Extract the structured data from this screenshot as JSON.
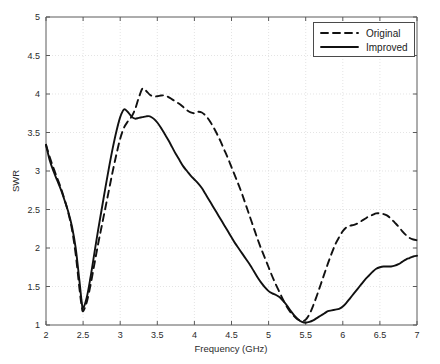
{
  "chart_data": {
    "type": "line",
    "title": "",
    "xlabel": "Frequency (GHz)",
    "ylabel": "SWR",
    "xlim": [
      2,
      7
    ],
    "ylim": [
      1,
      5
    ],
    "xticks": [
      2,
      2.5,
      3,
      3.5,
      4,
      4.5,
      5,
      5.5,
      6,
      6.5,
      7
    ],
    "xticklabels": [
      "2",
      "2.5",
      "3",
      "3.5",
      "4",
      "4.5",
      "5",
      "5.5",
      "6",
      "6.5",
      "7"
    ],
    "yticks": [
      1,
      1.5,
      2,
      2.5,
      3,
      3.5,
      4,
      4.5,
      5
    ],
    "yticklabels": [
      "1",
      "1.5",
      "2",
      "2.5",
      "3",
      "3.5",
      "4",
      "4.5",
      "5"
    ],
    "grid": true,
    "legend_position": "upper right",
    "legend_entries": [
      "Original",
      "Improved"
    ],
    "series": [
      {
        "name": "Original",
        "style": "dashed",
        "color": "#111111",
        "x": [
          2.0,
          2.05,
          2.1,
          2.15,
          2.2,
          2.25,
          2.3,
          2.35,
          2.4,
          2.45,
          2.48,
          2.5,
          2.55,
          2.6,
          2.65,
          2.7,
          2.75,
          2.8,
          2.85,
          2.9,
          2.95,
          3.0,
          3.05,
          3.1,
          3.15,
          3.2,
          3.25,
          3.3,
          3.35,
          3.4,
          3.45,
          3.5,
          3.55,
          3.6,
          3.65,
          3.7,
          3.75,
          3.8,
          3.85,
          3.9,
          3.95,
          4.0,
          4.05,
          4.1,
          4.15,
          4.2,
          4.25,
          4.3,
          4.35,
          4.4,
          4.45,
          4.5,
          4.55,
          4.6,
          4.65,
          4.7,
          4.75,
          4.8,
          4.85,
          4.9,
          4.95,
          5.0,
          5.05,
          5.1,
          5.15,
          5.2,
          5.25,
          5.3,
          5.35,
          5.4,
          5.45,
          5.5,
          5.55,
          5.6,
          5.65,
          5.7,
          5.75,
          5.8,
          5.85,
          5.9,
          5.95,
          6.0,
          6.05,
          6.1,
          6.15,
          6.2,
          6.25,
          6.3,
          6.35,
          6.4,
          6.45,
          6.5,
          6.55,
          6.6,
          6.65,
          6.7,
          6.75,
          6.8,
          6.85,
          6.9,
          6.95,
          7.0
        ],
        "y": [
          3.34,
          3.18,
          3.04,
          2.91,
          2.78,
          2.63,
          2.46,
          2.24,
          1.92,
          1.48,
          1.25,
          1.18,
          1.3,
          1.52,
          1.78,
          2.04,
          2.28,
          2.52,
          2.76,
          3.0,
          3.22,
          3.42,
          3.56,
          3.64,
          3.7,
          3.8,
          3.95,
          4.07,
          4.04,
          3.99,
          3.97,
          3.97,
          3.98,
          3.98,
          3.96,
          3.93,
          3.9,
          3.87,
          3.83,
          3.79,
          3.76,
          3.75,
          3.77,
          3.76,
          3.72,
          3.66,
          3.58,
          3.49,
          3.39,
          3.28,
          3.17,
          3.05,
          2.93,
          2.81,
          2.68,
          2.54,
          2.4,
          2.26,
          2.12,
          1.99,
          1.87,
          1.75,
          1.63,
          1.52,
          1.42,
          1.32,
          1.23,
          1.16,
          1.11,
          1.07,
          1.05,
          1.07,
          1.14,
          1.25,
          1.38,
          1.52,
          1.66,
          1.8,
          1.93,
          2.05,
          2.14,
          2.22,
          2.27,
          2.29,
          2.3,
          2.32,
          2.35,
          2.38,
          2.41,
          2.43,
          2.45,
          2.45,
          2.44,
          2.42,
          2.38,
          2.33,
          2.28,
          2.22,
          2.17,
          2.13,
          2.11,
          2.1
        ]
      },
      {
        "name": "Improved",
        "style": "solid",
        "color": "#111111",
        "x": [
          2.0,
          2.05,
          2.1,
          2.15,
          2.2,
          2.25,
          2.3,
          2.35,
          2.4,
          2.45,
          2.48,
          2.5,
          2.55,
          2.6,
          2.65,
          2.7,
          2.75,
          2.8,
          2.85,
          2.9,
          2.95,
          3.0,
          3.05,
          3.1,
          3.15,
          3.2,
          3.25,
          3.3,
          3.35,
          3.4,
          3.45,
          3.5,
          3.55,
          3.6,
          3.65,
          3.7,
          3.75,
          3.8,
          3.85,
          3.9,
          3.95,
          4.0,
          4.05,
          4.1,
          4.15,
          4.2,
          4.25,
          4.3,
          4.35,
          4.4,
          4.45,
          4.5,
          4.55,
          4.6,
          4.65,
          4.7,
          4.75,
          4.8,
          4.85,
          4.9,
          4.95,
          5.0,
          5.05,
          5.1,
          5.15,
          5.2,
          5.25,
          5.3,
          5.35,
          5.4,
          5.45,
          5.5,
          5.55,
          5.6,
          5.65,
          5.7,
          5.75,
          5.8,
          5.85,
          5.9,
          5.95,
          6.0,
          6.05,
          6.1,
          6.15,
          6.2,
          6.25,
          6.3,
          6.35,
          6.4,
          6.45,
          6.5,
          6.55,
          6.6,
          6.65,
          6.7,
          6.75,
          6.8,
          6.85,
          6.9,
          6.95,
          7.0
        ],
        "y": [
          3.34,
          3.14,
          3.0,
          2.88,
          2.76,
          2.62,
          2.47,
          2.28,
          2.0,
          1.58,
          1.31,
          1.22,
          1.36,
          1.62,
          1.92,
          2.22,
          2.5,
          2.78,
          3.05,
          3.3,
          3.52,
          3.7,
          3.8,
          3.77,
          3.71,
          3.68,
          3.69,
          3.7,
          3.71,
          3.71,
          3.68,
          3.63,
          3.56,
          3.48,
          3.4,
          3.31,
          3.22,
          3.14,
          3.06,
          3.0,
          2.94,
          2.89,
          2.84,
          2.78,
          2.7,
          2.62,
          2.54,
          2.46,
          2.38,
          2.3,
          2.22,
          2.14,
          2.06,
          1.99,
          1.92,
          1.85,
          1.78,
          1.7,
          1.62,
          1.55,
          1.49,
          1.44,
          1.41,
          1.39,
          1.36,
          1.31,
          1.25,
          1.18,
          1.12,
          1.07,
          1.04,
          1.03,
          1.04,
          1.06,
          1.09,
          1.12,
          1.15,
          1.18,
          1.19,
          1.2,
          1.21,
          1.24,
          1.29,
          1.35,
          1.41,
          1.47,
          1.53,
          1.59,
          1.64,
          1.69,
          1.73,
          1.75,
          1.76,
          1.76,
          1.76,
          1.77,
          1.79,
          1.82,
          1.85,
          1.87,
          1.89,
          1.9
        ]
      }
    ]
  },
  "legend": {
    "items": [
      {
        "label": "Original",
        "style": "dashed"
      },
      {
        "label": "Improved",
        "style": "solid"
      }
    ]
  },
  "axes": {
    "x_title": "Frequency (GHz)",
    "y_title": "SWR"
  }
}
